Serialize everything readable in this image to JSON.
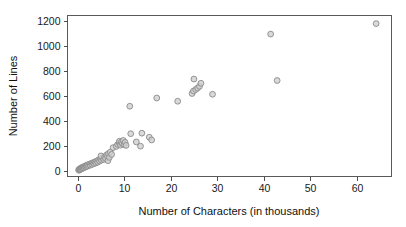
{
  "chart_data": {
    "type": "scatter",
    "title": "",
    "xlabel": "Number of Characters (in thousands)",
    "ylabel": "Number of Lines",
    "xlim": [
      -2.2,
      67.5
    ],
    "ylim": [
      -45,
      1245
    ],
    "xticks": [
      0,
      10,
      20,
      30,
      40,
      50,
      60
    ],
    "xtick_labels": [
      "0",
      "10",
      "20",
      "30",
      "40",
      "50",
      "60"
    ],
    "yticks": [
      0,
      200,
      400,
      600,
      800,
      1000,
      1200
    ],
    "ytick_labels": [
      "0",
      "200",
      "400",
      "600",
      "800",
      "1000",
      "1200"
    ],
    "grid": false,
    "legend": null,
    "marker": {
      "shape": "circle",
      "radius_px": 2.9,
      "fill": "#cfcfcf",
      "stroke": "#8a8a8a",
      "fill_opacity": 0.8
    },
    "series": [
      {
        "name": "files",
        "points": [
          [
            0.2,
            8
          ],
          [
            0.3,
            5
          ],
          [
            0.35,
            12
          ],
          [
            0.45,
            10
          ],
          [
            0.5,
            18
          ],
          [
            0.6,
            14
          ],
          [
            0.7,
            22
          ],
          [
            0.8,
            16
          ],
          [
            0.9,
            26
          ],
          [
            1.0,
            20
          ],
          [
            1.1,
            30
          ],
          [
            1.2,
            24
          ],
          [
            1.3,
            34
          ],
          [
            1.45,
            28
          ],
          [
            1.6,
            38
          ],
          [
            1.7,
            32
          ],
          [
            1.85,
            44
          ],
          [
            2.0,
            36
          ],
          [
            2.1,
            48
          ],
          [
            2.3,
            42
          ],
          [
            2.5,
            54
          ],
          [
            2.7,
            46
          ],
          [
            2.9,
            60
          ],
          [
            3.1,
            52
          ],
          [
            3.3,
            66
          ],
          [
            3.5,
            58
          ],
          [
            3.7,
            72
          ],
          [
            3.9,
            64
          ],
          [
            4.1,
            80
          ],
          [
            4.3,
            70
          ],
          [
            4.5,
            88
          ],
          [
            4.7,
            78
          ],
          [
            4.9,
            96
          ],
          [
            5.1,
            86
          ],
          [
            5.3,
            104
          ],
          [
            5.0,
            120
          ],
          [
            5.6,
            92
          ],
          [
            5.8,
            112
          ],
          [
            6.0,
            100
          ],
          [
            6.2,
            128
          ],
          [
            6.4,
            116
          ],
          [
            6.6,
            138
          ],
          [
            6.5,
            82
          ],
          [
            6.8,
            108
          ],
          [
            7.0,
            150
          ],
          [
            7.3,
            132
          ],
          [
            7.6,
            186
          ],
          [
            8.3,
            196
          ],
          [
            8.6,
            212
          ],
          [
            8.9,
            226
          ],
          [
            9.0,
            238
          ],
          [
            9.2,
            206
          ],
          [
            9.4,
            232
          ],
          [
            9.6,
            218
          ],
          [
            9.8,
            244
          ],
          [
            10.0,
            210
          ],
          [
            10.2,
            228
          ],
          [
            10.4,
            204
          ],
          [
            11.2,
            518
          ],
          [
            11.4,
            298
          ],
          [
            12.6,
            232
          ],
          [
            13.5,
            198
          ],
          [
            13.8,
            302
          ],
          [
            15.4,
            270
          ],
          [
            15.9,
            248
          ],
          [
            17.0,
            584
          ],
          [
            21.5,
            558
          ],
          [
            24.6,
            620
          ],
          [
            24.9,
            640
          ],
          [
            25.0,
            736
          ],
          [
            25.4,
            652
          ],
          [
            25.8,
            664
          ],
          [
            26.2,
            678
          ],
          [
            26.5,
            702
          ],
          [
            29.0,
            614
          ],
          [
            41.5,
            1096
          ],
          [
            42.9,
            724
          ],
          [
            64.2,
            1180
          ]
        ]
      }
    ]
  },
  "axes": {
    "x_title": "Number of Characters (in thousands)",
    "y_title": "Number of Lines"
  }
}
